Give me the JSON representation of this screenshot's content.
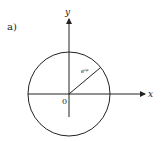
{
  "figure": {
    "panel_label": "a)",
    "x_axis_label": "x",
    "y_axis_label": "y",
    "origin_label": "0",
    "radius_label": "e^{iφ}",
    "radius_label_display": "eⁱᵠ",
    "colors": {
      "stroke": "#222222",
      "background": "#ffffff"
    }
  }
}
